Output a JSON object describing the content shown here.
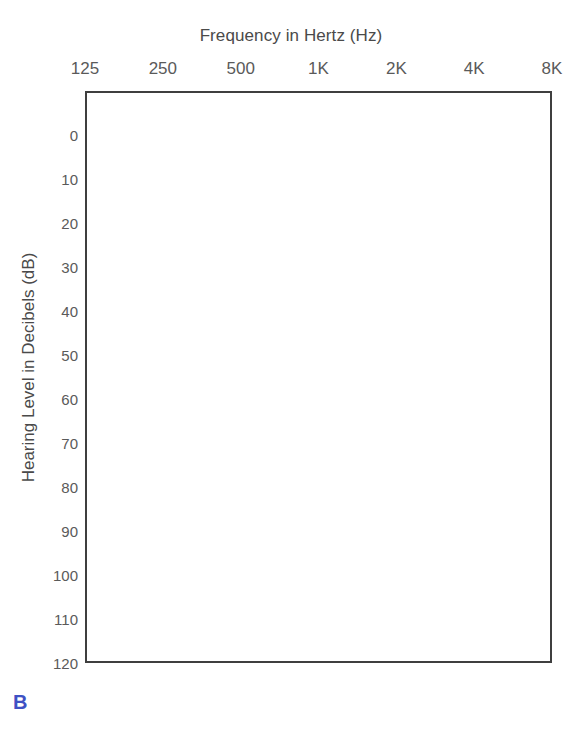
{
  "panel_label": "B",
  "chart_data": {
    "type": "heatmap",
    "title": "Frequency in Hertz (Hz)",
    "xlabel": "Frequency in Hertz (Hz)",
    "ylabel": "Hearing Level in Decibels (dB)",
    "categories": [
      "125",
      "250",
      "500",
      "1K",
      "2K",
      "4K",
      "8K"
    ],
    "x_tick_labels": [
      "125",
      "250",
      "500",
      "1K",
      "2K",
      "4K",
      "8K"
    ],
    "y_tick_labels": [
      "0",
      "10",
      "20",
      "30",
      "40",
      "50",
      "60",
      "70",
      "80",
      "90",
      "100",
      "110",
      "120"
    ],
    "y_tick_values": [
      0,
      10,
      20,
      30,
      40,
      50,
      60,
      70,
      80,
      90,
      100,
      110,
      120
    ],
    "ylim": [
      -10,
      120
    ],
    "y_inverted": true,
    "grid": true,
    "legend": false,
    "series": [],
    "annotations": [
      {
        "name": "shaded-frequency-band",
        "kind": "vertical-band",
        "x_start": "1K",
        "x_end": "2K",
        "y_start": -10,
        "y_end": 120,
        "fill": "#8287d9",
        "pattern": "diagonal-hatch",
        "label": "B"
      }
    ],
    "colors": {
      "band_fill": "#8287d9",
      "hatch": "#ffffff",
      "gridline": "#3f3f3f",
      "text": "#5a5a5a",
      "panel_label": "#3f51c4",
      "background": "#ffffff"
    }
  }
}
